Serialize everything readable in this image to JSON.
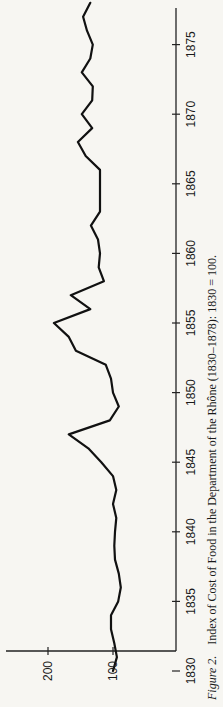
{
  "figure": {
    "caption_label": "Figure 2.",
    "caption_text": "Index of Cost of Food in the Department of the Rhône (1830–1878): 1830 = 100.",
    "orientation": "rotated 90° counter-clockwise"
  },
  "colors": {
    "background": "#f7f6f2",
    "line": "#111111",
    "axis": "#222222",
    "text": "#1a1a1a"
  },
  "chart_data": {
    "type": "line",
    "title": "Index of Cost of Food in the Department of the Rhône (1830–1878): 1830 = 100",
    "xlabel": "",
    "ylabel": "",
    "x_ticks": [
      1830,
      1835,
      1840,
      1845,
      1850,
      1855,
      1860,
      1865,
      1870,
      1875
    ],
    "y_ticks": [
      100,
      200
    ],
    "xlim": [
      1829,
      1879
    ],
    "ylim": [
      50,
      215
    ],
    "grid": false,
    "legend": null,
    "x": [
      1830,
      1831,
      1832,
      1833,
      1834,
      1835,
      1836,
      1837,
      1838,
      1839,
      1840,
      1841,
      1842,
      1843,
      1844,
      1845,
      1846,
      1847,
      1848,
      1849,
      1850,
      1851,
      1852,
      1853,
      1854,
      1855,
      1856,
      1857,
      1858,
      1859,
      1860,
      1861,
      1862,
      1863,
      1864,
      1865,
      1866,
      1867,
      1868,
      1869,
      1870,
      1871,
      1872,
      1873,
      1874,
      1875,
      1876,
      1877,
      1878
    ],
    "series": [
      {
        "name": "Cost of food index",
        "values": [
          100,
          94,
          98,
          103,
          103,
          92,
          88,
          91,
          97,
          98,
          97,
          95,
          100,
          95,
          100,
          118,
          138,
          168,
          105,
          91,
          100,
          103,
          111,
          157,
          168,
          191,
          135,
          165,
          114,
          122,
          120,
          123,
          134,
          120,
          120,
          120,
          120,
          142,
          154,
          132,
          148,
          132,
          131,
          148,
          135,
          131,
          140,
          146,
          135
        ]
      }
    ]
  }
}
